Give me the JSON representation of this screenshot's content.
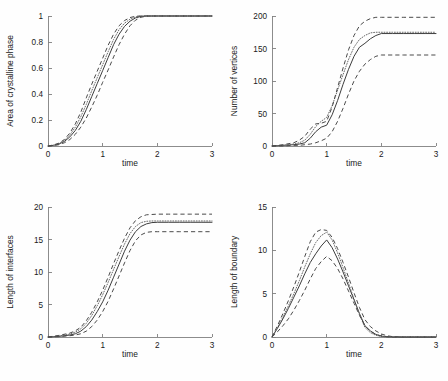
{
  "figure": {
    "background": "#fefefe",
    "axis_color": "#808080",
    "line_color": "#3c3c3c",
    "panel_count": 4
  },
  "chart_data": [
    {
      "type": "line",
      "panel": "top-left",
      "title": "",
      "xlabel": "time",
      "ylabel": "Area of crystalline phase",
      "xlim": [
        0,
        3
      ],
      "ylim": [
        0,
        1
      ],
      "xticks": [
        0,
        1,
        2,
        3
      ],
      "xticklabels": [
        "0",
        "1",
        "2",
        "3"
      ],
      "yticks": [
        0,
        0.2,
        0.4,
        0.6,
        0.8,
        1
      ],
      "yticklabels": [
        "0",
        "0.2",
        "0.4",
        "0.6",
        "0.8",
        "1"
      ],
      "grid": false,
      "legend": "none",
      "x": [
        0,
        0.1,
        0.2,
        0.3,
        0.4,
        0.5,
        0.6,
        0.7,
        0.8,
        0.9,
        1.0,
        1.1,
        1.2,
        1.3,
        1.4,
        1.5,
        1.6,
        1.7,
        1.8,
        1.9,
        2.0,
        2.2,
        2.4,
        2.6,
        2.8,
        3.0
      ],
      "series": [
        {
          "name": "mean",
          "style": "solid",
          "values": [
            0,
            0.005,
            0.015,
            0.035,
            0.07,
            0.12,
            0.19,
            0.28,
            0.38,
            0.48,
            0.58,
            0.68,
            0.78,
            0.86,
            0.92,
            0.96,
            0.985,
            0.997,
            1.0,
            1.0,
            1.0,
            1.0,
            1.0,
            1.0,
            1.0,
            1.0
          ]
        },
        {
          "name": "median",
          "style": "dotted",
          "values": [
            0,
            0.006,
            0.018,
            0.042,
            0.085,
            0.145,
            0.225,
            0.32,
            0.425,
            0.525,
            0.625,
            0.725,
            0.82,
            0.895,
            0.945,
            0.975,
            0.993,
            1.0,
            1.0,
            1.0,
            1.0,
            1.0,
            1.0,
            1.0,
            1.0,
            1.0
          ]
        },
        {
          "name": "upper bound",
          "style": "dashed",
          "values": [
            0,
            0.008,
            0.022,
            0.05,
            0.1,
            0.17,
            0.26,
            0.37,
            0.475,
            0.575,
            0.675,
            0.775,
            0.86,
            0.925,
            0.965,
            0.988,
            0.998,
            1.0,
            1.0,
            1.0,
            1.0,
            1.0,
            1.0,
            1.0,
            1.0,
            1.0
          ]
        },
        {
          "name": "lower bound",
          "style": "dashed",
          "values": [
            0,
            0.003,
            0.01,
            0.025,
            0.05,
            0.09,
            0.145,
            0.215,
            0.3,
            0.39,
            0.49,
            0.585,
            0.685,
            0.78,
            0.86,
            0.925,
            0.968,
            0.99,
            0.999,
            1.0,
            1.0,
            1.0,
            1.0,
            1.0,
            1.0,
            1.0
          ]
        }
      ]
    },
    {
      "type": "line",
      "panel": "top-right",
      "title": "",
      "xlabel": "time",
      "ylabel": "Number of vertices",
      "xlim": [
        0,
        3
      ],
      "ylim": [
        0,
        200
      ],
      "xticks": [
        0,
        1,
        2,
        3
      ],
      "xticklabels": [
        "0",
        "1",
        "2",
        "3"
      ],
      "yticks": [
        0,
        50,
        100,
        150,
        200
      ],
      "yticklabels": [
        "0",
        "50",
        "100",
        "150",
        "200"
      ],
      "grid": false,
      "legend": "none",
      "x": [
        0,
        0.2,
        0.4,
        0.5,
        0.6,
        0.7,
        0.8,
        0.9,
        1.0,
        1.1,
        1.2,
        1.3,
        1.4,
        1.5,
        1.6,
        1.7,
        1.8,
        1.9,
        2.0,
        2.2,
        2.4,
        2.6,
        2.8,
        3.0
      ],
      "series": [
        {
          "name": "mean",
          "style": "solid",
          "values": [
            0,
            1,
            2,
            3,
            5,
            12,
            22,
            29,
            32,
            48,
            70,
            95,
            118,
            138,
            152,
            158,
            165,
            170,
            173,
            173,
            173,
            173,
            173,
            173
          ]
        },
        {
          "name": "median",
          "style": "dotted",
          "values": [
            0,
            1,
            3,
            5,
            9,
            18,
            30,
            38,
            44,
            62,
            86,
            110,
            133,
            152,
            164,
            170,
            174,
            175,
            175,
            175,
            175,
            175,
            175,
            175
          ]
        },
        {
          "name": "upper bound",
          "style": "dashed",
          "values": [
            0,
            2,
            5,
            9,
            15,
            26,
            34,
            35,
            38,
            60,
            90,
            120,
            148,
            170,
            185,
            192,
            196,
            198,
            198,
            198,
            198,
            198,
            198,
            198
          ]
        },
        {
          "name": "lower bound",
          "style": "dashed",
          "values": [
            0,
            0,
            1,
            1,
            2,
            3,
            5,
            8,
            12,
            22,
            38,
            58,
            80,
            100,
            115,
            126,
            133,
            138,
            140,
            140,
            140,
            140,
            140,
            140
          ]
        }
      ]
    },
    {
      "type": "line",
      "panel": "bottom-left",
      "title": "",
      "xlabel": "time",
      "ylabel": "Length of interfaces",
      "xlim": [
        0,
        3
      ],
      "ylim": [
        0,
        20
      ],
      "xticks": [
        0,
        1,
        2,
        3
      ],
      "xticklabels": [
        "0",
        "1",
        "2",
        "3"
      ],
      "yticks": [
        0,
        5,
        10,
        15,
        20
      ],
      "yticklabels": [
        "0",
        "5",
        "10",
        "15",
        "20"
      ],
      "grid": false,
      "legend": "none",
      "x": [
        0,
        0.2,
        0.4,
        0.5,
        0.6,
        0.7,
        0.8,
        0.9,
        1.0,
        1.1,
        1.2,
        1.3,
        1.4,
        1.5,
        1.6,
        1.7,
        1.8,
        1.9,
        2.0,
        2.2,
        2.4,
        2.6,
        2.8,
        3.0
      ],
      "series": [
        {
          "name": "mean",
          "style": "solid",
          "values": [
            0,
            0.1,
            0.3,
            0.5,
            0.9,
            1.6,
            2.6,
            3.9,
            5.4,
            7.2,
            9.2,
            11.2,
            13.2,
            14.9,
            16.2,
            17.0,
            17.4,
            17.6,
            17.65,
            17.65,
            17.65,
            17.65,
            17.65,
            17.65
          ]
        },
        {
          "name": "median",
          "style": "dotted",
          "values": [
            0,
            0.15,
            0.45,
            0.75,
            1.25,
            2.1,
            3.3,
            4.8,
            6.5,
            8.4,
            10.4,
            12.4,
            14.3,
            15.9,
            17.0,
            17.6,
            17.8,
            17.85,
            17.85,
            17.85,
            17.85,
            17.85,
            17.85,
            17.85
          ]
        },
        {
          "name": "upper bound",
          "style": "dashed",
          "values": [
            0,
            0.25,
            0.6,
            0.95,
            1.5,
            2.5,
            3.8,
            5.4,
            7.2,
            9.2,
            11.3,
            13.3,
            15.2,
            16.8,
            17.9,
            18.5,
            18.8,
            18.85,
            18.9,
            18.9,
            18.9,
            18.9,
            18.9,
            18.9
          ]
        },
        {
          "name": "lower bound",
          "style": "dashed",
          "values": [
            0,
            0.05,
            0.2,
            0.3,
            0.5,
            0.9,
            1.6,
            2.6,
            3.9,
            5.5,
            7.4,
            9.4,
            11.4,
            13.3,
            14.8,
            15.7,
            16.1,
            16.2,
            16.2,
            16.2,
            16.2,
            16.2,
            16.2,
            16.2
          ]
        }
      ]
    },
    {
      "type": "line",
      "panel": "bottom-right",
      "title": "",
      "xlabel": "time",
      "ylabel": "Length of boundary",
      "xlim": [
        0,
        3
      ],
      "ylim": [
        0,
        15
      ],
      "xticks": [
        0,
        1,
        2,
        3
      ],
      "xticklabels": [
        "0",
        "1",
        "2",
        "3"
      ],
      "yticks": [
        0,
        5,
        10,
        15
      ],
      "yticklabels": [
        "0",
        "5",
        "10",
        "15"
      ],
      "grid": false,
      "legend": "none",
      "x": [
        0,
        0.1,
        0.2,
        0.3,
        0.4,
        0.5,
        0.6,
        0.7,
        0.8,
        0.9,
        1.0,
        1.1,
        1.2,
        1.3,
        1.4,
        1.5,
        1.6,
        1.7,
        1.8,
        1.9,
        2.0,
        2.1,
        2.2,
        2.4,
        2.6,
        3.0
      ],
      "series": [
        {
          "name": "mean",
          "style": "solid",
          "values": [
            0,
            1.0,
            2.1,
            3.3,
            4.6,
            5.9,
            7.3,
            8.6,
            9.6,
            10.5,
            11.2,
            10.3,
            9.0,
            7.5,
            5.9,
            4.3,
            2.7,
            1.3,
            0.7,
            0.3,
            0.1,
            0.03,
            0,
            0,
            0,
            0
          ]
        },
        {
          "name": "median",
          "style": "dotted",
          "values": [
            0,
            1.1,
            2.3,
            3.6,
            5.0,
            6.5,
            8.1,
            9.6,
            10.9,
            11.7,
            12.1,
            11.2,
            9.7,
            8.0,
            6.2,
            4.4,
            2.6,
            1.1,
            0.5,
            0.2,
            0.05,
            0,
            0,
            0,
            0,
            0
          ]
        },
        {
          "name": "upper bound",
          "style": "dashed",
          "values": [
            0,
            1.3,
            2.7,
            4.2,
            5.8,
            7.5,
            9.3,
            11.0,
            12.1,
            12.4,
            12.3,
            11.5,
            10.2,
            8.6,
            6.9,
            5.1,
            3.4,
            2.0,
            1.2,
            0.7,
            0.35,
            0.15,
            0.05,
            0,
            0,
            0
          ]
        },
        {
          "name": "lower bound",
          "style": "dashed",
          "values": [
            0,
            0.6,
            1.3,
            2.1,
            3.1,
            4.2,
            5.4,
            6.7,
            7.9,
            8.7,
            9.3,
            8.8,
            7.9,
            6.7,
            5.3,
            3.9,
            2.5,
            1.3,
            0.65,
            0.3,
            0.12,
            0.04,
            0,
            0,
            0,
            0
          ]
        }
      ]
    }
  ]
}
